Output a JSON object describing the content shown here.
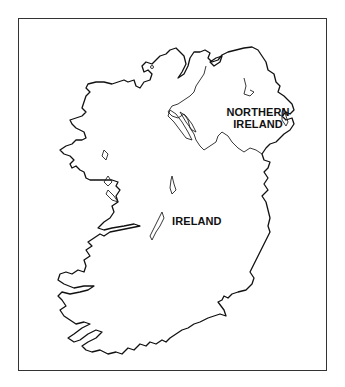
{
  "map": {
    "title_region": "Island of Ireland",
    "labels": [
      {
        "id": "northern-ireland",
        "lines": [
          "NORTHERN",
          "IRELAND"
        ]
      },
      {
        "id": "ireland",
        "lines": [
          "IRELAND"
        ]
      }
    ],
    "frame": {
      "x": 18,
      "y": 18,
      "width": 309,
      "height": 353,
      "stroke": "#333333"
    },
    "colors": {
      "background": "#ffffff",
      "coastline": "#111111",
      "border": "#222222",
      "label": "#111111"
    }
  }
}
